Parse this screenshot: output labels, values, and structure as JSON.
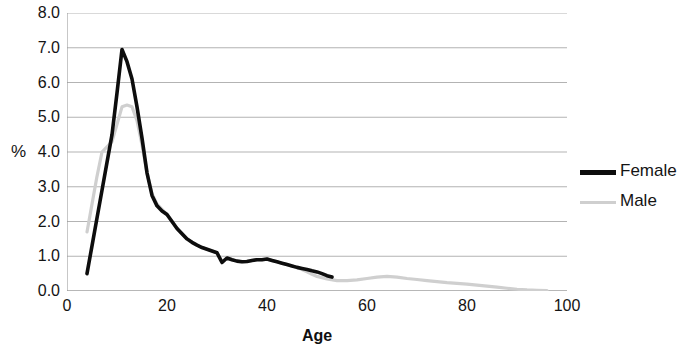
{
  "chart_data": {
    "type": "line",
    "title": "",
    "xlabel": "Age",
    "ylabel": "%",
    "xlim": [
      0,
      100
    ],
    "ylim": [
      0,
      8
    ],
    "grid": true,
    "grid_axis": "y",
    "legend_position": "right",
    "xticks": [
      "0",
      "20",
      "40",
      "60",
      "80",
      "100"
    ],
    "xtick_values": [
      0,
      20,
      40,
      60,
      80,
      100
    ],
    "yticks": [
      "0.0",
      "1.0",
      "2.0",
      "3.0",
      "4.0",
      "5.0",
      "6.0",
      "7.0",
      "8.0"
    ],
    "ytick_values": [
      0,
      1,
      2,
      3,
      4,
      5,
      6,
      7,
      8
    ],
    "series": [
      {
        "name": "Female",
        "color": "#0d0d0d",
        "width": 3.6,
        "x": [
          4,
          5,
          6,
          7,
          8,
          9,
          10,
          11,
          12,
          13,
          14,
          15,
          16,
          17,
          18,
          19,
          20,
          21,
          22,
          23,
          24,
          25,
          26,
          27,
          28,
          29,
          30,
          31,
          32,
          33,
          34,
          35,
          36,
          37,
          38,
          39,
          40,
          41,
          42,
          43,
          44,
          45,
          46,
          47,
          48,
          49,
          50,
          51,
          52,
          53
        ],
        "y": [
          0.5,
          1.3,
          2.1,
          2.9,
          3.7,
          4.5,
          5.7,
          6.95,
          6.6,
          6.1,
          5.3,
          4.4,
          3.4,
          2.75,
          2.45,
          2.3,
          2.2,
          2.0,
          1.8,
          1.65,
          1.5,
          1.4,
          1.32,
          1.25,
          1.2,
          1.15,
          1.1,
          0.82,
          0.95,
          0.9,
          0.86,
          0.84,
          0.85,
          0.88,
          0.9,
          0.9,
          0.92,
          0.88,
          0.84,
          0.8,
          0.76,
          0.72,
          0.68,
          0.65,
          0.62,
          0.58,
          0.55,
          0.5,
          0.44,
          0.4
        ]
      },
      {
        "name": "Male",
        "color": "#cfcfcf",
        "width": 3.2,
        "x": [
          4,
          5,
          6,
          7,
          8,
          9,
          10,
          11,
          12,
          13,
          14,
          15,
          16,
          17,
          18,
          19,
          20,
          21,
          22,
          23,
          24,
          25,
          26,
          27,
          28,
          29,
          30,
          31,
          32,
          33,
          34,
          35,
          36,
          37,
          38,
          39,
          40,
          41,
          42,
          43,
          44,
          45,
          46,
          47,
          48,
          49,
          50,
          52,
          54,
          56,
          58,
          60,
          62,
          64,
          66,
          68,
          70,
          72,
          74,
          76,
          78,
          80,
          82,
          84,
          86,
          88,
          90,
          92,
          94,
          96
        ],
        "y": [
          1.7,
          2.5,
          3.3,
          4.0,
          4.15,
          4.3,
          4.8,
          5.3,
          5.35,
          5.3,
          4.9,
          4.2,
          3.4,
          2.8,
          2.5,
          2.35,
          2.2,
          2.0,
          1.8,
          1.65,
          1.5,
          1.4,
          1.32,
          1.25,
          1.2,
          1.15,
          1.1,
          0.85,
          0.95,
          0.9,
          0.86,
          0.84,
          0.85,
          0.88,
          0.9,
          0.9,
          0.92,
          0.88,
          0.84,
          0.8,
          0.76,
          0.72,
          0.68,
          0.62,
          0.55,
          0.48,
          0.42,
          0.35,
          0.3,
          0.3,
          0.32,
          0.36,
          0.4,
          0.42,
          0.4,
          0.36,
          0.33,
          0.3,
          0.27,
          0.24,
          0.22,
          0.2,
          0.17,
          0.14,
          0.11,
          0.08,
          0.05,
          0.03,
          0.02,
          0.01
        ]
      }
    ]
  },
  "legend": {
    "items": [
      {
        "label": "Female",
        "style": "female"
      },
      {
        "label": "Male",
        "style": "male"
      }
    ]
  }
}
